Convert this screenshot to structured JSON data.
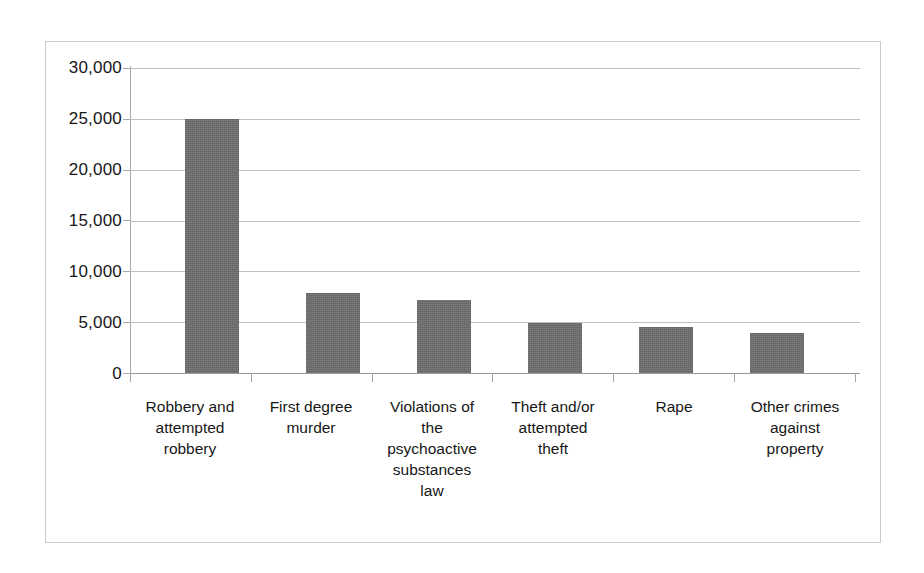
{
  "chart_data": {
    "type": "bar",
    "title": "",
    "subtitle": "",
    "xlabel": "",
    "ylabel": "",
    "ylim": [
      0,
      30000
    ],
    "ytick_labels": [
      "30,000",
      "25,000",
      "20,000",
      "15,000",
      "10,000",
      "5,000",
      "0"
    ],
    "ytick_values": [
      30000,
      25000,
      20000,
      15000,
      10000,
      5000,
      0
    ],
    "grid": true,
    "legend": "none",
    "bar_color": "#6e6e6e",
    "categories": [
      "Robbery and attempted robbery",
      "First degree murder",
      "Violations of the psychoactive substances law",
      "Theft and/or attempted theft",
      "Rape",
      "Other crimes against property"
    ],
    "category_lines": [
      [
        "Robbery and",
        "attempted",
        "robbery"
      ],
      [
        "First degree",
        "murder"
      ],
      [
        "Violations of",
        "the",
        "psychoactive",
        "substances",
        "law"
      ],
      [
        "Theft and/or",
        "attempted",
        "theft"
      ],
      [
        "Rape"
      ],
      [
        "Other crimes",
        "against",
        "property"
      ]
    ],
    "values": [
      25000,
      7900,
      7200,
      4900,
      4500,
      3900
    ]
  }
}
